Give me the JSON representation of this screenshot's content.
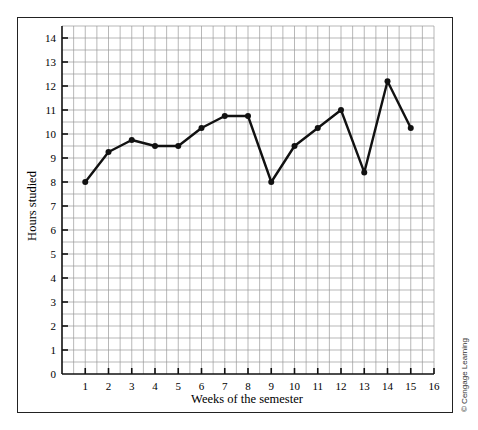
{
  "chart_data": {
    "type": "line",
    "title": "",
    "xlabel": "Weeks of the semester",
    "ylabel": "Hours studied",
    "x": [
      1,
      2,
      3,
      4,
      5,
      6,
      7,
      8,
      9,
      10,
      11,
      12,
      13,
      14,
      15
    ],
    "series": [
      {
        "name": "Hours studied",
        "values": [
          8,
          9.25,
          9.75,
          9.5,
          9.5,
          10.25,
          10.75,
          10.75,
          8,
          9.5,
          10.25,
          11,
          8.4,
          12.2,
          10.25
        ]
      }
    ],
    "x_ticks": [
      "1",
      "2",
      "3",
      "4",
      "5",
      "6",
      "7",
      "8",
      "9",
      "10",
      "11",
      "12",
      "13",
      "14",
      "15",
      "16"
    ],
    "y_ticks": [
      "0",
      "1",
      "2",
      "3",
      "4",
      "5",
      "6",
      "7",
      "8",
      "9",
      "10",
      "11",
      "12",
      "13",
      "14"
    ],
    "xlim": [
      0,
      16
    ],
    "ylim": [
      0,
      14.5
    ],
    "grid": true,
    "grid_minor_step": 0.5,
    "legend": "none",
    "line_color": "#111111",
    "grid_color": "#9a9a9a"
  },
  "credit": "© Cengage Learning"
}
